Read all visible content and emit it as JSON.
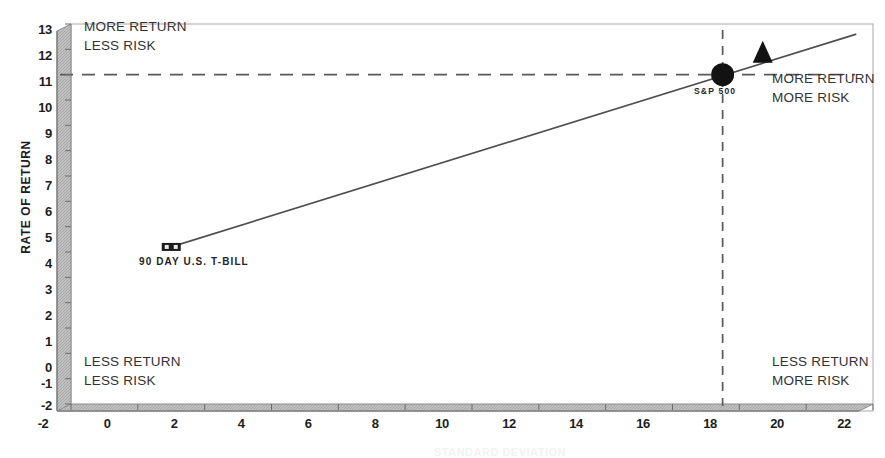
{
  "chart_data": {
    "type": "scatter",
    "title": "",
    "xlabel": "STANDARD DEVIATION",
    "ylabel": "RATE OF RETURN",
    "xlim": [
      -2,
      22
    ],
    "ylim": [
      -2,
      13
    ],
    "xticks": [
      "-2",
      "0",
      "2",
      "4",
      "6",
      "8",
      "10",
      "12",
      "14",
      "16",
      "18",
      "20",
      "22"
    ],
    "xtick_values": [
      -2,
      0,
      2,
      4,
      6,
      8,
      10,
      12,
      14,
      16,
      18,
      20,
      22
    ],
    "yticks": [
      "13",
      "12",
      "11",
      "10",
      "9",
      "8",
      "7",
      "6",
      "5",
      "4",
      "3",
      "2",
      "1",
      "0",
      "-1",
      "-2"
    ],
    "ytick_values": [
      13,
      12,
      11,
      10,
      9,
      8,
      7,
      6,
      5,
      4,
      3,
      2,
      1,
      0,
      -1,
      -2
    ],
    "grid": false,
    "legend": "none",
    "points": [
      {
        "name": "90 DAY U.S. T-BILL",
        "label": "90 DAY U.S. T-BILL",
        "x": 1.0,
        "y": 4.2,
        "marker": "square",
        "color": "#1a1a1a"
      },
      {
        "name": "S&P 500",
        "label": "S&P 500",
        "x": 17.5,
        "y": 11.0,
        "marker": "circle",
        "color": "#1a1a1a"
      },
      {
        "name": "unlabeled-portfolio",
        "label": "",
        "x": 18.7,
        "y": 11.9,
        "marker": "triangle",
        "color": "#1a1a1a"
      }
    ],
    "series": [
      {
        "name": "capital market line",
        "type": "line",
        "x": [
          1.0,
          21.5
        ],
        "y": [
          4.2,
          12.6
        ],
        "style": "solid",
        "color": "#4a4a4a"
      }
    ],
    "reference_lines": [
      {
        "name": "return-reference",
        "orientation": "horizontal",
        "value": 11.0,
        "style": "dashed",
        "color": "#4a4a4a"
      },
      {
        "name": "risk-reference",
        "orientation": "vertical",
        "value": 17.5,
        "style": "dashed",
        "color": "#4a4a4a"
      }
    ],
    "annotations": [
      {
        "name": "top-left",
        "lines": [
          "MORE RETURN",
          "LESS RISK"
        ]
      },
      {
        "name": "top-right",
        "lines": [
          "MORE RETURN",
          "MORE RISK"
        ]
      },
      {
        "name": "bottom-left",
        "lines": [
          "LESS RETURN",
          "LESS RISK"
        ]
      },
      {
        "name": "bottom-right",
        "lines": [
          "LESS RETURN",
          "MORE RISK"
        ]
      }
    ],
    "colors": {
      "axis_face": "#b8b8b8",
      "axis_edge": "#8a8a8a",
      "plot_border": "#9a9a9a",
      "marker": "#1a1a1a",
      "line": "#4a4a4a"
    }
  }
}
